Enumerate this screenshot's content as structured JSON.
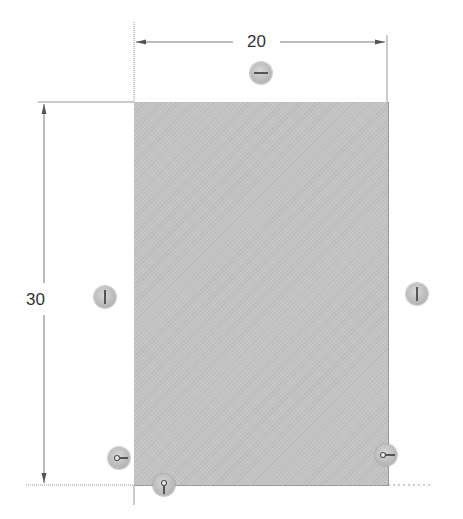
{
  "sketch": {
    "shape": "rectangle",
    "fill_color": "#c4c4c4",
    "dimensions": {
      "width": {
        "label": "20",
        "orientation": "horizontal"
      },
      "height": {
        "label": "30",
        "orientation": "vertical"
      }
    },
    "relations": [
      {
        "name": "horizontal-top",
        "icon": "horizontal-relation-icon"
      },
      {
        "name": "vertical-left",
        "icon": "vertical-relation-icon"
      },
      {
        "name": "vertical-right",
        "icon": "vertical-relation-icon"
      },
      {
        "name": "coincident-bottom-left-horizontal",
        "icon": "coincident-horizontal-icon"
      },
      {
        "name": "coincident-bottom-left-vertical",
        "icon": "coincident-vertical-icon"
      },
      {
        "name": "coincident-bottom-right",
        "icon": "coincident-horizontal-icon"
      }
    ]
  }
}
